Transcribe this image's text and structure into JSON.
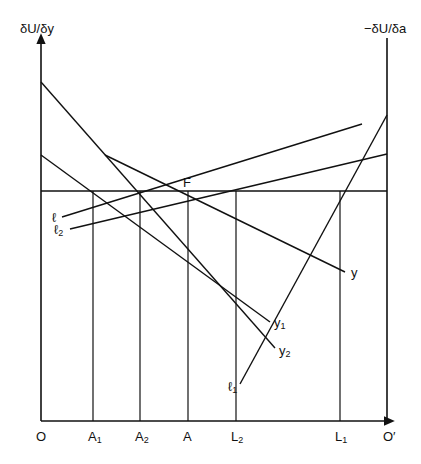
{
  "axes": {
    "left_label": "δU/δy",
    "right_label": "−δU/δa",
    "origin_left": "O",
    "origin_right": "O′"
  },
  "x_ticks": [
    {
      "base": "A",
      "sub": "1",
      "x": 93
    },
    {
      "base": "A",
      "sub": "2",
      "x": 140
    },
    {
      "base": "A",
      "sub": "",
      "x": 188
    },
    {
      "base": "L",
      "sub": "2",
      "x": 236
    },
    {
      "base": "L",
      "sub": "1",
      "x": 340
    }
  ],
  "point_label": "F",
  "curves": [
    {
      "name": "y",
      "label_base": "y",
      "label_sub": "",
      "x1": 105,
      "y1": 155,
      "x2": 345,
      "y2": 272
    },
    {
      "name": "y1",
      "label_base": "y",
      "label_sub": "1",
      "x1": 41,
      "y1": 155,
      "x2": 270,
      "y2": 322
    },
    {
      "name": "y2",
      "label_base": "y",
      "label_sub": "2",
      "x1": 41,
      "y1": 82,
      "x2": 275,
      "y2": 348
    },
    {
      "name": "l",
      "label_base": "ℓ",
      "label_sub": "",
      "x1": 62,
      "y1": 217,
      "x2": 362,
      "y2": 124
    },
    {
      "name": "l2",
      "label_base": "ℓ",
      "label_sub": "2",
      "x1": 70,
      "y1": 229,
      "x2": 387,
      "y2": 154
    },
    {
      "name": "l1",
      "label_base": "ℓ",
      "label_sub": "1",
      "x1": 240,
      "y1": 384,
      "x2": 387,
      "y2": 115
    }
  ],
  "horizontal_line_y": 191,
  "colors": {
    "line": "#111111",
    "background": "#ffffff"
  }
}
